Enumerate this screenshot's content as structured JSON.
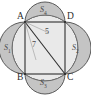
{
  "figure": {
    "type": "geometry-diagram",
    "background_color": "#ffffff",
    "stroke_color": "#4d4d4d",
    "lune_fill_color": "#c9c9c9",
    "circle_fill_color": "#e6e6e6"
  },
  "vertices": {
    "a": "A",
    "b": "B",
    "c": "C",
    "d": "D"
  },
  "regions": {
    "left": {
      "base": "S",
      "sub": "1"
    },
    "bottom": {
      "base": "S",
      "sub": "3"
    },
    "right": {
      "base": "S",
      "sub": "2"
    },
    "top": {
      "base": "S",
      "sub": "4"
    }
  },
  "measures": {
    "diagonal": "5",
    "side": "7"
  },
  "geometry": {
    "rect": {
      "x": 25,
      "y": 22,
      "width": 40,
      "height": 52
    },
    "circle": {
      "cx": 45,
      "cy": 48,
      "r": 33
    }
  }
}
